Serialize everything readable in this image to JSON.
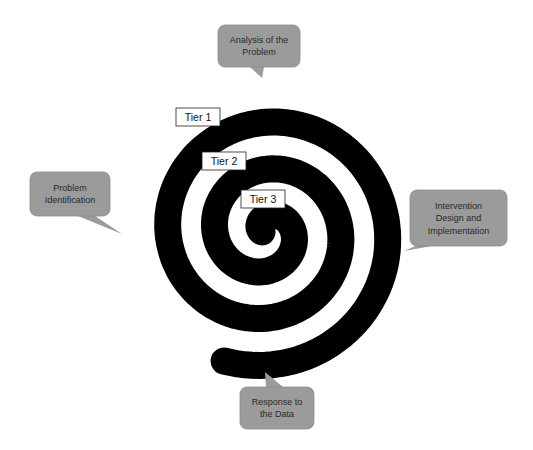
{
  "diagram": {
    "type": "spiral-process",
    "colors": {
      "spiral": "#000000",
      "callout_fill": "#9b9b9b",
      "callout_stroke": "#8a8a8a",
      "callout_text": "#2a2a2a",
      "tier_fill": "#ffffff",
      "tier_stroke": "#222222"
    },
    "spiral": {
      "cx": 266,
      "cy": 232,
      "start_radius": 4,
      "spacing_per_turn": 47,
      "start_angle_deg": 0,
      "end_angle_deg": 1010,
      "band_width": 27
    },
    "tiers": [
      {
        "label": "Tier 1",
        "x": 176,
        "y": 108,
        "w": 44,
        "h": 18
      },
      {
        "label": "Tier 2",
        "x": 202,
        "y": 152,
        "w": 44,
        "h": 18
      },
      {
        "label": "Tier 3",
        "x": 241,
        "y": 190,
        "w": 44,
        "h": 18
      }
    ],
    "callouts": [
      {
        "id": "analysis",
        "lines": [
          "Analysis of the",
          "Problem"
        ],
        "x": 218,
        "y": 25,
        "w": 82,
        "h": 42,
        "pointer": [
          [
            250,
            67
          ],
          [
            262,
            78
          ],
          [
            264,
            67
          ]
        ]
      },
      {
        "id": "identification",
        "lines": [
          "Problem",
          "Identification"
        ],
        "x": 30,
        "y": 172,
        "w": 80,
        "h": 44,
        "pointer": [
          [
            78,
            216
          ],
          [
            122,
            234
          ],
          [
            95,
            216
          ]
        ]
      },
      {
        "id": "intervention",
        "lines": [
          "Intervention",
          "Design and",
          "Implementation"
        ],
        "x": 410,
        "y": 190,
        "w": 97,
        "h": 56,
        "pointer": [
          [
            420,
            244
          ],
          [
            404,
            251
          ],
          [
            432,
            246
          ]
        ]
      },
      {
        "id": "response",
        "lines": [
          "Response to",
          "the Data"
        ],
        "x": 240,
        "y": 387,
        "w": 74,
        "h": 42,
        "pointer": [
          [
            266,
            387
          ],
          [
            265,
            372
          ],
          [
            283,
            387
          ]
        ]
      }
    ]
  }
}
